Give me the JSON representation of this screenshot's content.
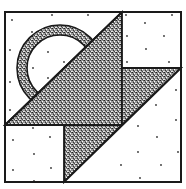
{
  "diagram": {
    "type": "quilt-block",
    "colors": {
      "background": "#ffffff",
      "outline": "#1a1a1a",
      "stipple_dark": "#2b2b2b",
      "stipple_light": "#ffffff",
      "dot": "#333333"
    },
    "frame": {
      "x": 5,
      "y": 12,
      "width": 176,
      "height": 170
    },
    "pieces": [
      {
        "name": "top-right-square",
        "fill": "plain",
        "points": [
          [
            122,
            12
          ],
          [
            181,
            12
          ],
          [
            181,
            68
          ],
          [
            122,
            68
          ]
        ]
      },
      {
        "name": "bottom-left-square",
        "fill": "plain",
        "points": [
          [
            5,
            125
          ],
          [
            64,
            125
          ],
          [
            64,
            182
          ],
          [
            5,
            182
          ]
        ]
      },
      {
        "name": "bottom-right-triangle",
        "fill": "plain",
        "points": [
          [
            181,
            68
          ],
          [
            181,
            182
          ],
          [
            64,
            182
          ]
        ]
      },
      {
        "name": "large-center-triangle",
        "fill": "stipple",
        "points": [
          [
            5,
            125
          ],
          [
            122,
            12
          ],
          [
            122,
            125
          ]
        ]
      },
      {
        "name": "upper-right-triangle",
        "fill": "stipple",
        "points": [
          [
            122,
            68
          ],
          [
            181,
            68
          ],
          [
            122,
            125
          ]
        ]
      },
      {
        "name": "lower-center-triangle",
        "fill": "stipple",
        "points": [
          [
            64,
            125
          ],
          [
            122,
            125
          ],
          [
            64,
            182
          ]
        ]
      },
      {
        "name": "arc-band",
        "fill": "stipple",
        "center": [
          60,
          68
        ],
        "outer_r": 43,
        "inner_r": 33
      }
    ]
  }
}
